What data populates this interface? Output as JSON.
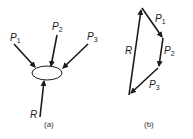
{
  "figure": {
    "panel_a": {
      "caption": "(a)",
      "forces": [
        {
          "name": "P",
          "sub": "1"
        },
        {
          "name": "P",
          "sub": "2"
        },
        {
          "name": "P",
          "sub": "3"
        },
        {
          "name": "R",
          "sub": ""
        }
      ]
    },
    "panel_b": {
      "caption": "(b)",
      "forces": [
        {
          "name": "P",
          "sub": "1"
        },
        {
          "name": "P",
          "sub": "2"
        },
        {
          "name": "P",
          "sub": "3"
        },
        {
          "name": "R",
          "sub": ""
        }
      ]
    },
    "colors": {
      "line": "#1a1a1a",
      "background": "#ffffff"
    }
  }
}
